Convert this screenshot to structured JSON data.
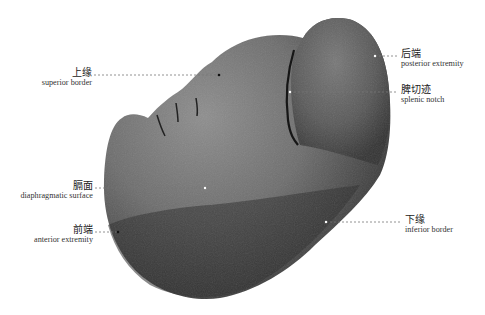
{
  "figure": {
    "background": "#ffffff",
    "organ_colors": {
      "light": "#8a8a8a",
      "mid": "#5e5e5e",
      "dark": "#2e2e2e"
    },
    "labels": [
      {
        "id": "superior-border",
        "zh": "上缘",
        "en": "superior border",
        "side": "left"
      },
      {
        "id": "posterior-extremity",
        "zh": "后端",
        "en": "posterior extremity",
        "side": "right"
      },
      {
        "id": "splenic-notch",
        "zh": "脾切迹",
        "en": "splenic notch",
        "side": "right"
      },
      {
        "id": "diaphragmatic-surface",
        "zh": "膈面",
        "en": "diaphragmatic surface",
        "side": "left"
      },
      {
        "id": "inferior-border",
        "zh": "下缘",
        "en": "inferior border",
        "side": "right"
      },
      {
        "id": "anterior-extremity",
        "zh": "前端",
        "en": "anterior extremity",
        "side": "left"
      }
    ]
  }
}
